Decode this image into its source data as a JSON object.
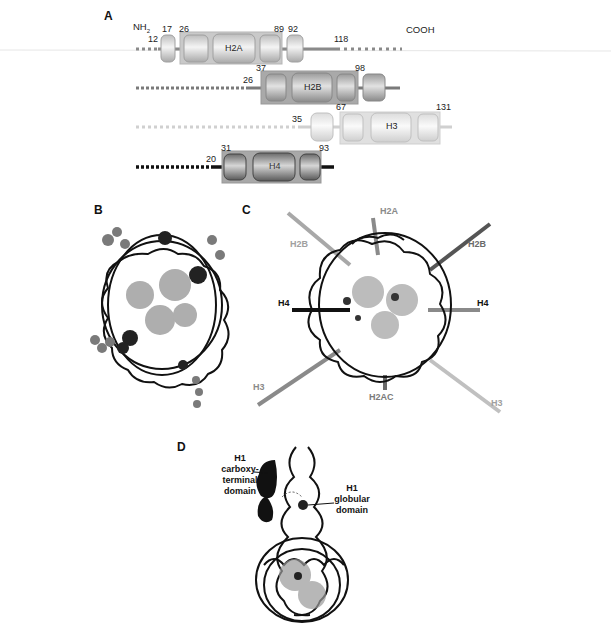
{
  "panels": {
    "A": {
      "letter": "A",
      "n_terminus": "NH2",
      "n_terminus_base": "NH",
      "n_terminus_sub": "2",
      "c_terminus": "COOH",
      "histones": [
        {
          "name": "H2A",
          "residue_labels": [
            "12",
            "17",
            "26",
            "89",
            "92",
            "118"
          ],
          "color": "#c8c8c8"
        },
        {
          "name": "H2B",
          "residue_labels": [
            "26",
            "37",
            "98"
          ],
          "color": "#a8a8a8"
        },
        {
          "name": "H3",
          "residue_labels": [
            "35",
            "67",
            "131"
          ],
          "color": "#e0e0e0"
        },
        {
          "name": "H4",
          "residue_labels": [
            "20",
            "31",
            "93"
          ],
          "color": "#303030"
        }
      ]
    },
    "B": {
      "letter": "B"
    },
    "C": {
      "letter": "C",
      "tail_labels": [
        {
          "text": "H2A",
          "color": "#8a8a8a"
        },
        {
          "text": "H2B",
          "color": "#a0a0a0"
        },
        {
          "text": "H2B",
          "color": "#6a6a6a"
        },
        {
          "text": "H4",
          "color": "#111111"
        },
        {
          "text": "H4",
          "color": "#111111"
        },
        {
          "text": "H3",
          "color": "#8a8a8a"
        },
        {
          "text": "H2AC",
          "color": "#7a7a7a"
        },
        {
          "text": "H3",
          "color": "#a0a0a0"
        }
      ]
    },
    "D": {
      "letter": "D",
      "labels": {
        "ctd_line1": "H1",
        "ctd_line2": "carboxy-terminal",
        "ctd_line3": "domain",
        "glob_line1": "H1",
        "glob_line2": "globular",
        "glob_line3": "domain"
      }
    }
  }
}
